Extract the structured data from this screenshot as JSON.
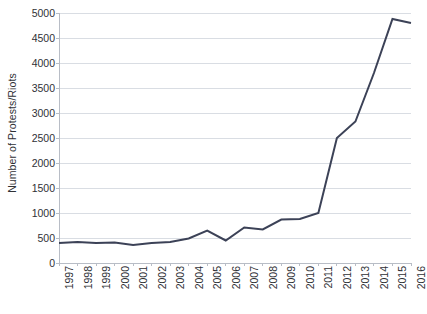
{
  "chart_data": {
    "type": "line",
    "title": "",
    "xlabel": "",
    "ylabel": "Number of Protests/Riots",
    "categories": [
      "1997",
      "1998",
      "1999",
      "2000",
      "2001",
      "2002",
      "2003",
      "2004",
      "2005",
      "2006",
      "2007",
      "2008",
      "2009",
      "2010",
      "2011",
      "2012",
      "2013",
      "2014",
      "2015",
      "2016"
    ],
    "values": [
      400,
      420,
      400,
      410,
      360,
      400,
      420,
      490,
      650,
      450,
      710,
      670,
      870,
      880,
      1000,
      2500,
      2830,
      3800,
      4880,
      4800
    ],
    "series": [
      {
        "name": "Number of Protests/Riots",
        "values": [
          400,
          420,
          400,
          410,
          360,
          400,
          420,
          490,
          650,
          450,
          710,
          670,
          870,
          880,
          1000,
          2500,
          2830,
          3800,
          4880,
          4800
        ]
      }
    ],
    "ylim": [
      0,
      5000
    ],
    "y_ticks": [
      0,
      500,
      1000,
      1500,
      2000,
      2500,
      3000,
      3500,
      4000,
      4500,
      5000
    ],
    "y_tick_labels": [
      "0",
      "500",
      "1000",
      "1500",
      "2000",
      "2500",
      "3000",
      "3500",
      "4000",
      "4500",
      "5000"
    ],
    "x_tick_labels": [
      "1997",
      "1998",
      "1999",
      "2000",
      "2001",
      "2002",
      "2003",
      "2004",
      "2005",
      "2006",
      "2007",
      "2008",
      "2009",
      "2010",
      "2011",
      "2012",
      "2013",
      "2014",
      "2015",
      "2016"
    ],
    "grid": "horizontal",
    "legend": "none",
    "line_color": "#3c4257",
    "grid_color": "#d9dde3",
    "axis_color": "#b8bdc6",
    "background": "#ffffff",
    "line_width": 2
  }
}
